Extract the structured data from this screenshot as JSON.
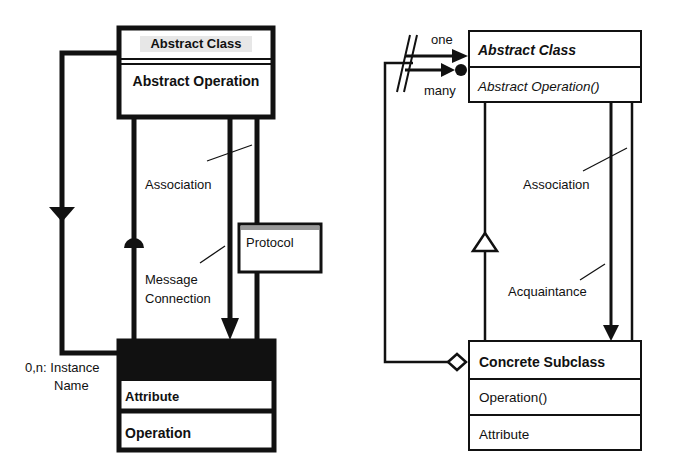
{
  "left_diagram": {
    "abstract_class": {
      "name": "Abstract Class",
      "operation": "Abstract Operation"
    },
    "labels": {
      "association": "Association",
      "message_line1": "Message",
      "message_line2": "Connection",
      "instance_line1": "0,n: Instance",
      "instance_line2": "Name"
    },
    "protocol": {
      "name": "Protocol"
    },
    "instance_box": {
      "attribute": "Attribute",
      "operation": "Operation"
    }
  },
  "right_diagram": {
    "abstract_class": {
      "name": "Abstract Class",
      "operation": "Abstract Operation()"
    },
    "multiplicity": {
      "one": "one",
      "many": "many"
    },
    "labels": {
      "association": "Association",
      "acquaintance": "Acquaintance"
    },
    "concrete_subclass": {
      "name": "Concrete Subclass",
      "operation": "Operation()",
      "attribute": "Attribute"
    }
  },
  "colors": {
    "ink": "#111111",
    "background": "#ffffff"
  }
}
